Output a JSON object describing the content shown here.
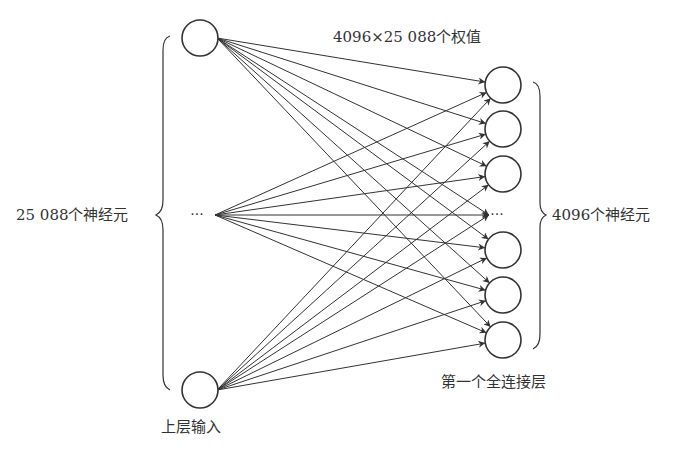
{
  "diagram": {
    "weights_label": "4096×25 088个权值",
    "input_count_label": "25 088个神经元",
    "output_count_label": "4096个神经元",
    "input_layer_label": "上层输入",
    "output_layer_label": "第一个全连接层",
    "ellipsis": "···",
    "input_nodes": [
      {
        "id": "in-top",
        "x": 200,
        "y": 38
      },
      {
        "id": "in-ellipsis",
        "x": 197,
        "y": 215,
        "ellipsis": true
      },
      {
        "id": "in-bottom",
        "x": 200,
        "y": 390
      }
    ],
    "output_nodes": [
      {
        "id": "out-1",
        "x": 503,
        "y": 85
      },
      {
        "id": "out-2",
        "x": 503,
        "y": 129
      },
      {
        "id": "out-3",
        "x": 503,
        "y": 174
      },
      {
        "id": "out-ellipsis",
        "x": 497,
        "y": 215,
        "ellipsis": true
      },
      {
        "id": "out-5",
        "x": 503,
        "y": 250
      },
      {
        "id": "out-6",
        "x": 503,
        "y": 295
      },
      {
        "id": "out-7",
        "x": 503,
        "y": 340
      }
    ],
    "node_radius": 18,
    "stroke_color": "#333333"
  }
}
